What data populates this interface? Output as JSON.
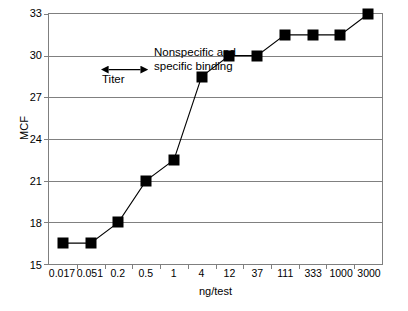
{
  "chart_data": {
    "type": "line",
    "title": "",
    "xlabel": "ng/test",
    "ylabel": "MCF",
    "categories": [
      "0.017",
      "0.051",
      "0.2",
      "0.5",
      "1",
      "4",
      "12",
      "37",
      "111",
      "333",
      "1000",
      "3000"
    ],
    "values": [
      16.5,
      16.5,
      18,
      21,
      22.5,
      28.5,
      30,
      30,
      31.5,
      31.5,
      31.5,
      33
    ],
    "series": [
      {
        "name": "MCF",
        "values": [
          16.5,
          16.5,
          18,
          21,
          22.5,
          28.5,
          30,
          30,
          31.5,
          31.5,
          31.5,
          33
        ]
      }
    ],
    "ylim": [
      15,
      33
    ],
    "yticks": [
      15,
      18,
      21,
      24,
      27,
      30,
      33
    ],
    "ytick_labels": [
      "15",
      "18",
      "21",
      "24",
      "27",
      "30",
      "33"
    ],
    "grid": true,
    "legend": false,
    "marker": "square",
    "marker_color": "#000000",
    "line_color": "#000000",
    "grid_color": "#808080",
    "annotations": [
      {
        "name": "binding-annotation",
        "line1": "Nonspecific and",
        "line2": "specific binding"
      },
      {
        "name": "titer-annotation",
        "label": "Titer",
        "arrow": "double-headed",
        "from_category": "12",
        "to_category": "37"
      }
    ]
  }
}
